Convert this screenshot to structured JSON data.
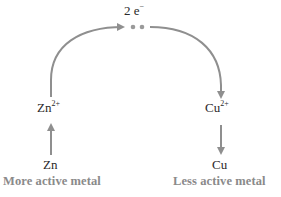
{
  "diagram": {
    "electron_label": {
      "count": "2",
      "symbol": "e",
      "charge": "−"
    },
    "left": {
      "ion": {
        "symbol": "Zn",
        "charge": "2+"
      },
      "metal": "Zn",
      "caption": "More active metal"
    },
    "right": {
      "ion": {
        "symbol": "Cu",
        "charge": "2+"
      },
      "metal": "Cu",
      "caption": "Less active metal"
    },
    "colors": {
      "arrow": "#8f8f8f",
      "text": "#2a2a2a",
      "caption": "#8a8a8a"
    }
  }
}
